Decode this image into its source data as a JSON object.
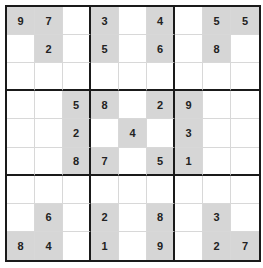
{
  "puzzle": {
    "type": "sudoku",
    "size": 9,
    "colors": {
      "given_bg": "#d6d6d6",
      "empty_bg": "#ffffff",
      "thick_line": "#1a1a1a",
      "thin_line": "#d8d8d8",
      "digit": "#222222"
    },
    "grid": [
      [
        "9",
        "7",
        "",
        "3",
        "",
        "4",
        "",
        "5",
        "5"
      ],
      [
        "",
        "2",
        "",
        "5",
        "",
        "6",
        "",
        "8",
        ""
      ],
      [
        "",
        "",
        "",
        "",
        "",
        "",
        "",
        "",
        ""
      ],
      [
        "",
        "",
        "5",
        "8",
        "",
        "2",
        "9",
        "",
        ""
      ],
      [
        "",
        "",
        "2",
        "",
        "4",
        "",
        "3",
        "",
        ""
      ],
      [
        "",
        "",
        "8",
        "7",
        "",
        "5",
        "1",
        "",
        ""
      ],
      [
        "",
        "",
        "",
        "",
        "",
        "",
        "",
        "",
        ""
      ],
      [
        "",
        "6",
        "",
        "2",
        "",
        "8",
        "",
        "3",
        ""
      ],
      [
        "8",
        "4",
        "",
        "1",
        "",
        "9",
        "",
        "2",
        "7"
      ]
    ]
  }
}
